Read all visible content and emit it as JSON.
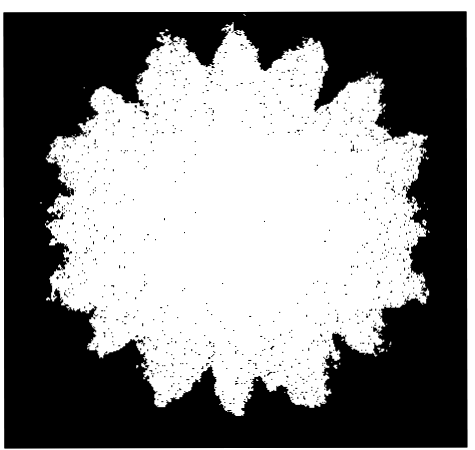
{
  "image": {
    "description": "White fractal aggregate (roughly circular, lace-like with jagged lobed edges and scattered black speckles) on a black rectangular background with a thin white margin",
    "caption": "Fractal aggregate on black background"
  },
  "colors": {
    "page_background": "#ffffff",
    "frame_background": "#000000",
    "fractal_color": "#ffffff"
  },
  "frame": {
    "left": 4,
    "top": 12,
    "width": 463,
    "height": 436
  },
  "fractal": {
    "center_x": 237,
    "center_y": 220,
    "radius_x": 188,
    "radius_y": 184,
    "lobes": 8,
    "lobe_amplitude": 0.07,
    "edge_roughness": 0.09,
    "speckle_density_center": 0.004,
    "speckle_density_edge": 0.16,
    "notches": [
      {
        "angle_deg": -100,
        "depth": 0.1
      },
      {
        "angle_deg": -80,
        "depth": 0.1
      },
      {
        "angle_deg": -55,
        "depth": 0.18
      },
      {
        "angle_deg": -130,
        "depth": 0.2
      },
      {
        "angle_deg": 0,
        "depth": 0.1
      },
      {
        "angle_deg": 180,
        "depth": 0.1
      },
      {
        "angle_deg": 50,
        "depth": 0.16
      },
      {
        "angle_deg": 130,
        "depth": 0.18
      },
      {
        "angle_deg": 85,
        "depth": 0.1
      },
      {
        "angle_deg": 100,
        "depth": 0.1
      }
    ],
    "seed": 1337
  }
}
